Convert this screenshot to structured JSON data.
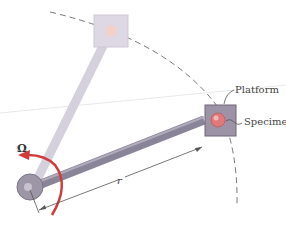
{
  "diagram": {
    "labels": {
      "platform": "Platform",
      "specimen": "Specimen",
      "angular_velocity": "Ω",
      "radius": "r"
    },
    "colors": {
      "arm": "#8a8499",
      "arm_faded": "#d4d0dc",
      "platform": "#9d93a6",
      "platform_faded": "#ded8e4",
      "specimen": "#e07a7a",
      "specimen_faded": "#f2d0cc",
      "rotation_arrow": "#d23b3b",
      "dashed_arc": "#777777"
    }
  }
}
